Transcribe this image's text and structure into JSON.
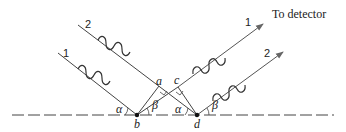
{
  "diagram": {
    "type": "x-ray diffraction geometry",
    "annotation": "To detector",
    "ray_labels": {
      "in_1": "1",
      "in_2": "2",
      "out_1": "1",
      "out_2": "2"
    },
    "points": {
      "a": "a",
      "b": "b",
      "c": "c",
      "d": "d"
    },
    "angles": {
      "alpha_left": "α",
      "beta_left": "β",
      "alpha_right": "α",
      "beta_right": "β"
    },
    "colors": {
      "line": "#444444",
      "arrow": "#666666",
      "text": "#222222"
    }
  }
}
